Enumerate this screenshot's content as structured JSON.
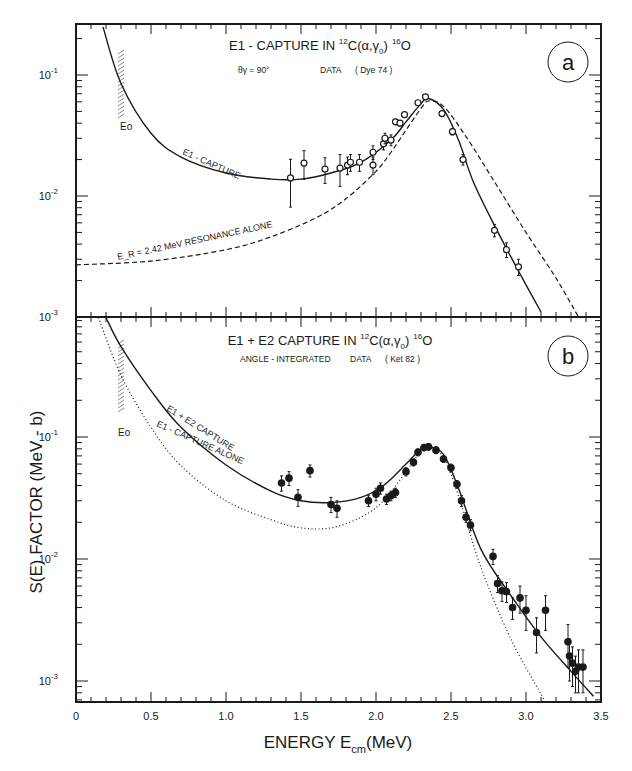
{
  "chart_data": [
    {
      "type": "scatter",
      "panel_label": "a",
      "title": "E1 - CAPTURE IN 12C(α,γ0)16O",
      "subtitle": "θγ = 90°   DATA (Dye 74)",
      "xlabel": "ENERGY E_cm (MeV)",
      "ylabel": "S(E) FACTOR (MeV - b)",
      "xlim": [
        0,
        3.5
      ],
      "ylim": [
        0.001,
        0.26
      ],
      "yscale": "log",
      "y_ticks": [
        "10^-1",
        "10^-2",
        "10^-3"
      ],
      "annotations": [
        "E1 - CAPTURE",
        "E_R = 2.42 MeV RESONANCE ALONE",
        "E_0"
      ],
      "E0_marker": 0.3,
      "series": [
        {
          "name": "Data (Dye 74)",
          "style": "open-circle-with-errorbars",
          "x": [
            1.43,
            1.52,
            1.66,
            1.76,
            1.81,
            1.83,
            1.89,
            1.98,
            1.98,
            2.05,
            2.06,
            2.1,
            2.13,
            2.16,
            2.19,
            2.28,
            2.33,
            2.44,
            2.51,
            2.58,
            2.79,
            2.87,
            2.95
          ],
          "y": [
            0.0141,
            0.0187,
            0.0167,
            0.017,
            0.018,
            0.019,
            0.019,
            0.023,
            0.018,
            0.027,
            0.03,
            0.029,
            0.041,
            0.04,
            0.047,
            0.059,
            0.066,
            0.048,
            0.034,
            0.02,
            0.0052,
            0.0036,
            0.0026
          ],
          "yerr": [
            0.006,
            0.005,
            0.004,
            0.005,
            0.003,
            0.003,
            0.003,
            0.003,
            0.003,
            0.003,
            0.003,
            0.003,
            0.002,
            0.002,
            0.002,
            0.002,
            0.002,
            0.002,
            0.002,
            0.002,
            0.0006,
            0.0005,
            0.0004
          ]
        },
        {
          "name": "E1 - CAPTURE",
          "style": "solid",
          "x": [
            0.18,
            0.3,
            0.5,
            0.7,
            1.0,
            1.3,
            1.5,
            1.7,
            1.9,
            2.1,
            2.2,
            2.3,
            2.35,
            2.45,
            2.55,
            2.65,
            2.8,
            2.95,
            3.1
          ],
          "y": [
            0.25,
            0.085,
            0.033,
            0.021,
            0.0155,
            0.0138,
            0.0138,
            0.0155,
            0.019,
            0.029,
            0.041,
            0.058,
            0.064,
            0.052,
            0.029,
            0.013,
            0.0054,
            0.0024,
            0.0011
          ]
        },
        {
          "name": "E_R = 2.42 MeV RESONANCE ALONE",
          "style": "dashed",
          "x": [
            0.0,
            0.5,
            1.0,
            1.3,
            1.6,
            1.8,
            2.0,
            2.1,
            2.2,
            2.3,
            2.35,
            2.45,
            2.6,
            2.8,
            3.0,
            3.2,
            3.35
          ],
          "y": [
            0.0027,
            0.0029,
            0.0036,
            0.0046,
            0.0066,
            0.0095,
            0.016,
            0.023,
            0.035,
            0.053,
            0.061,
            0.055,
            0.031,
            0.0125,
            0.005,
            0.0021,
            0.001
          ]
        }
      ]
    },
    {
      "type": "scatter",
      "panel_label": "b",
      "title": "E1 + E2 CAPTURE IN 12C(α,γ0)16O",
      "subtitle": "ANGLE - INTEGRATED DATA (Ket 82)",
      "xlabel": "ENERGY E_cm (MeV)",
      "ylabel": "S(E) FACTOR (MeV - b)",
      "xlim": [
        0,
        3.5
      ],
      "ylim": [
        0.0007,
        1.0
      ],
      "yscale": "log",
      "y_ticks": [
        "10^-1",
        "10^-2",
        "10^-3"
      ],
      "annotations": [
        "E1 + E2 CAPTURE",
        "E1 - CAPTURE ALONE",
        "E_0"
      ],
      "E0_marker": 0.3,
      "series": [
        {
          "name": "Data (Ket 82)",
          "style": "filled-circle-with-errorbars",
          "x": [
            1.37,
            1.42,
            1.56,
            1.48,
            1.7,
            1.74,
            1.95,
            2.0,
            2.03,
            2.07,
            2.1,
            2.13,
            2.2,
            2.25,
            2.28,
            2.32,
            2.35,
            2.4,
            2.45,
            2.5,
            2.54,
            2.57,
            2.6,
            2.63,
            2.78,
            2.81,
            2.84,
            2.87,
            2.91,
            2.96,
            3.0,
            3.07,
            3.13,
            3.28,
            3.29,
            3.31,
            3.33,
            3.35,
            3.38
          ],
          "y": [
            0.042,
            0.046,
            0.053,
            0.032,
            0.028,
            0.026,
            0.03,
            0.034,
            0.038,
            0.031,
            0.033,
            0.035,
            0.052,
            0.062,
            0.075,
            0.082,
            0.083,
            0.078,
            0.066,
            0.056,
            0.041,
            0.03,
            0.022,
            0.019,
            0.0105,
            0.0063,
            0.0055,
            0.0054,
            0.004,
            0.0048,
            0.0038,
            0.0025,
            0.0038,
            0.0021,
            0.0016,
            0.0014,
            0.0012,
            0.0013,
            0.0013
          ],
          "yerr": [
            0.006,
            0.006,
            0.006,
            0.005,
            0.004,
            0.004,
            0.003,
            0.004,
            0.004,
            0.003,
            0.003,
            0.003,
            0.004,
            0.004,
            0.005,
            0.005,
            0.005,
            0.005,
            0.004,
            0.004,
            0.003,
            0.003,
            0.002,
            0.002,
            0.0015,
            0.001,
            0.001,
            0.001,
            0.0008,
            0.0012,
            0.0012,
            0.0008,
            0.0012,
            0.0008,
            0.0006,
            0.0005,
            0.0004,
            0.0005,
            0.0005
          ]
        },
        {
          "name": "E1 + E2 CAPTURE",
          "style": "solid",
          "x": [
            0.2,
            0.3,
            0.5,
            0.7,
            1.0,
            1.3,
            1.5,
            1.7,
            1.9,
            2.05,
            2.2,
            2.3,
            2.35,
            2.45,
            2.55,
            2.7,
            2.9,
            3.1,
            3.3,
            3.45
          ],
          "y": [
            0.95,
            0.55,
            0.24,
            0.12,
            0.059,
            0.036,
            0.03,
            0.029,
            0.032,
            0.04,
            0.06,
            0.08,
            0.084,
            0.072,
            0.038,
            0.012,
            0.005,
            0.0023,
            0.0012,
            0.00075
          ]
        },
        {
          "name": "E1 - CAPTURE ALONE",
          "style": "dotted",
          "x": [
            0.15,
            0.3,
            0.5,
            0.7,
            1.0,
            1.3,
            1.5,
            1.7,
            1.9,
            2.05,
            2.2,
            2.3,
            2.35,
            2.45,
            2.55,
            2.7,
            2.9,
            3.1,
            3.15
          ],
          "y": [
            0.95,
            0.32,
            0.12,
            0.058,
            0.03,
            0.021,
            0.018,
            0.018,
            0.022,
            0.03,
            0.052,
            0.077,
            0.082,
            0.068,
            0.033,
            0.0085,
            0.0022,
            0.00078,
            0.0006
          ]
        }
      ]
    }
  ],
  "figure": {
    "panel_a": {
      "title_main": "E1 - CAPTURE IN ",
      "title_pre_sup": "12",
      "title_reaction": "C(α,γ",
      "title_sub": "0",
      "title_close": ")",
      "title_post_sup": "16",
      "title_product": "O",
      "subtitle_angle": "θγ = 90°",
      "subtitle_data": "DATA",
      "subtitle_ref": "( Dye 74 )",
      "label": "a",
      "curve_label_solid": "E1 - CAPTURE",
      "curve_label_dashed": "E_R = 2.42 MeV RESONANCE ALONE",
      "e0_label": "Eo"
    },
    "panel_b": {
      "title_main": "E1 + E2  CAPTURE IN ",
      "title_pre_sup": "12",
      "title_reaction": "C(α,γ",
      "title_sub": "0",
      "title_close": ")",
      "title_post_sup": "16",
      "title_product": "O",
      "subtitle_angle": "ANGLE - INTEGRATED",
      "subtitle_data": "DATA",
      "subtitle_ref": "( Ket 82 )",
      "label": "b",
      "curve_label_solid": "E1 + E2 CAPTURE",
      "curve_label_dotted": "E1 - CAPTURE ALONE",
      "e0_label": "Eo"
    },
    "y_axis_label": "S(E)   FACTOR   (MeV - b)",
    "x_axis_label_main": "ENERGY   E",
    "x_axis_label_sub": "cm",
    "x_axis_label_unit": "(MeV)",
    "x_tick_labels": [
      "0",
      "0.5",
      "1.0",
      "1.5",
      "2.0",
      "2.5",
      "3.0",
      "3.5"
    ],
    "y_tick_labels_a": [
      "10",
      "10",
      "10"
    ],
    "y_tick_exps_a": [
      "-1",
      "-2",
      "-3"
    ],
    "y_tick_labels_b": [
      "10",
      "10",
      "10"
    ],
    "y_tick_exps_b": [
      "-1",
      "-2",
      "-3"
    ]
  }
}
